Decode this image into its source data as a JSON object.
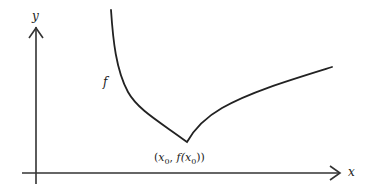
{
  "diagram": {
    "type": "function-plot",
    "axes": {
      "x_label": "x",
      "y_label": "y"
    },
    "curve": {
      "label": "f",
      "color": "#222222"
    },
    "point": {
      "label_open": "(",
      "x_name": "x",
      "x_sub": "0",
      "sep": ", ",
      "f_name": "f(",
      "x2_name": "x",
      "x2_sub": "0",
      "label_close": "))"
    },
    "colors": {
      "axis": "#333333",
      "curve": "#222222",
      "background": "#ffffff"
    }
  }
}
